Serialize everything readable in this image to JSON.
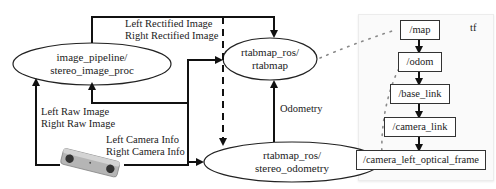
{
  "nodes": {
    "stereo_image_proc": {
      "line1": "image_pipeline/",
      "line2": "stereo_image_proc"
    },
    "rtabmap": {
      "line1": "rtabmap_ros/",
      "line2": "rtabmap"
    },
    "stereo_odometry": {
      "line1": "rtabmap_ros/",
      "line2": "stereo_odometry"
    }
  },
  "edge_labels": {
    "rectified_left": "Left Rectified Image",
    "rectified_right": "Right Rectified Image",
    "raw_left": "Left Raw Image",
    "raw_right": "Right Raw Image",
    "caminfo_left": "Left Camera Info",
    "caminfo_right": "Right Camera Info",
    "odometry": "Odometry"
  },
  "tf": {
    "title": "tf",
    "frames": [
      "/map",
      "/odom",
      "/base_link",
      "/camera_link",
      "/camera_left_optical_frame"
    ]
  },
  "device": {
    "name": "stereo-camera"
  },
  "colors": {
    "line": "#111111",
    "dots": "#8a8a8a",
    "panel": "#fafafa"
  }
}
